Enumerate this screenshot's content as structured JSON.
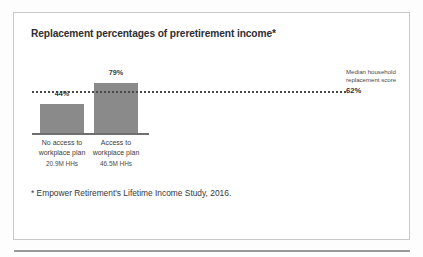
{
  "card": {
    "title": "Replacement percentages of preretirement income*",
    "footnote": "* Empower Retirement's Lifetime Income Study, 2016."
  },
  "legend": {
    "label": "Median household replacement score",
    "value": "62%"
  },
  "colors": {
    "bar": "#8a8a8a",
    "axis": "#6f6f6f",
    "median_line": "#4a4a4a",
    "card_border": "#c9c9c9",
    "title_text": "#2e2e33",
    "body_text": "#4a4a4a",
    "page_background": "#fdfdfd",
    "card_background": "#ffffff",
    "bottom_rule": "#9a9a9a"
  },
  "chart_data": {
    "type": "bar",
    "title": "Replacement percentages of preretirement income*",
    "xlabel": "",
    "ylabel": "",
    "ylim": [
      0,
      100
    ],
    "grid": false,
    "legend_position": "right",
    "categories": [
      "No access to workplace plan",
      "Access to workplace plan"
    ],
    "category_lines": [
      [
        "No access to",
        "workplace plan"
      ],
      [
        "Access to",
        "workplace plan"
      ]
    ],
    "values": [
      44,
      79
    ],
    "value_labels": [
      "44%",
      "79%"
    ],
    "category_sublabels": [
      "20.9M HHs",
      "46.5M HHs"
    ],
    "reference_line": {
      "label": "Median household replacement score",
      "value": 62,
      "value_label": "62%",
      "style": "dotted"
    },
    "annotations": [
      "* Empower Retirement's Lifetime Income Study, 2016."
    ]
  }
}
